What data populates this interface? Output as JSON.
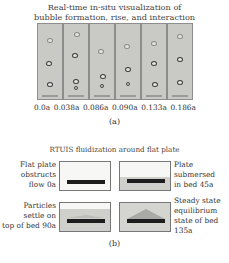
{
  "figure_a": {
    "title_line1": "Real-time in-situ visualization of",
    "title_line2": "bubble formation, rise, and interaction",
    "times": [
      "0.0a",
      "0.038a",
      "0.086a",
      "0.090a",
      "0.133a",
      "0.186a"
    ],
    "label": "(a)"
  },
  "figure_b": {
    "title": "RTUIS fluidization around flat plate",
    "panels": [
      {
        "caption_line1": "Flat plate",
        "caption_line2": "obstructs",
        "caption_line3": "flow 0a"
      },
      {
        "caption_line1": "Plate",
        "caption_line2": "submersed",
        "caption_line3": "in bed 45a"
      },
      {
        "caption_line1": "Particles",
        "caption_line2": "settle on",
        "caption_line3": "top of bed 90a"
      },
      {
        "caption_line1": "Steady state",
        "caption_line2": "equilibrium",
        "caption_line3": "state of bed",
        "caption_line4": "135a"
      }
    ],
    "label": "(b)"
  }
}
